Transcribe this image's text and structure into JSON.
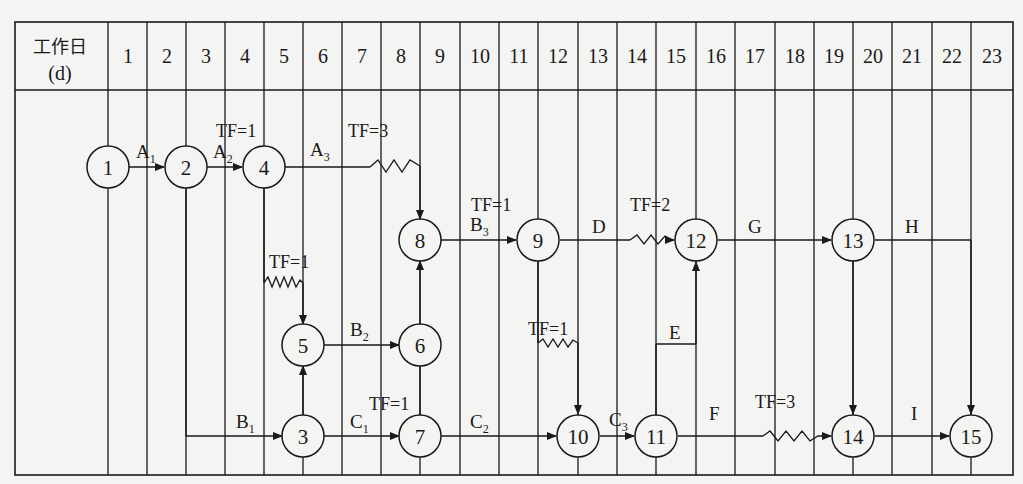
{
  "header": {
    "title_line1": "工作日",
    "title_line2": "(d)",
    "days": [
      "1",
      "2",
      "3",
      "4",
      "5",
      "6",
      "7",
      "8",
      "9",
      "10",
      "11",
      "12",
      "13",
      "14",
      "15",
      "16",
      "17",
      "18",
      "19",
      "20",
      "21",
      "22",
      "23"
    ]
  },
  "nodes": [
    {
      "id": "1",
      "label": "1",
      "day_line": 0,
      "row": "top"
    },
    {
      "id": "2",
      "label": "2",
      "day_line": 2,
      "row": "top"
    },
    {
      "id": "4",
      "label": "4",
      "day_line": 4,
      "row": "top"
    },
    {
      "id": "8",
      "label": "8",
      "day_line": 7,
      "row": "upper"
    },
    {
      "id": "9",
      "label": "9",
      "day_line": 10,
      "row": "upper"
    },
    {
      "id": "12",
      "label": "12",
      "day_line": 15,
      "row": "upper"
    },
    {
      "id": "13",
      "label": "13",
      "day_line": 19,
      "row": "upper"
    },
    {
      "id": "5",
      "label": "5",
      "day_line": 5,
      "row": "middle"
    },
    {
      "id": "6",
      "label": "6",
      "day_line": 8,
      "row": "middle"
    },
    {
      "id": "3",
      "label": "3",
      "day_line": 5,
      "row": "bottom"
    },
    {
      "id": "7",
      "label": "7",
      "day_line": 8,
      "row": "bottom"
    },
    {
      "id": "10",
      "label": "10",
      "day_line": 12,
      "row": "bottom"
    },
    {
      "id": "11",
      "label": "11",
      "day_line": 14,
      "row": "bottom"
    },
    {
      "id": "14",
      "label": "14",
      "day_line": 19,
      "row": "bottom"
    },
    {
      "id": "15",
      "label": "15",
      "day_line": 22,
      "row": "bottom"
    }
  ],
  "activities": [
    {
      "name": "A",
      "sub": "1",
      "from": "1",
      "to": "2"
    },
    {
      "name": "A",
      "sub": "2",
      "from": "2",
      "to": "4"
    },
    {
      "name": "A",
      "sub": "3",
      "from": "4",
      "to": "8",
      "free_float": "TF=3"
    },
    {
      "name": "B",
      "sub": "1",
      "from": "2",
      "to": "3"
    },
    {
      "name": "B",
      "sub": "2",
      "from": "5",
      "to": "6"
    },
    {
      "name": "B",
      "sub": "3",
      "from": "8",
      "to": "9",
      "free_float": "TF=1"
    },
    {
      "name": "C",
      "sub": "1",
      "from": "3",
      "to": "7",
      "free_float": "TF=1"
    },
    {
      "name": "C",
      "sub": "2",
      "from": "7",
      "to": "10"
    },
    {
      "name": "C",
      "sub": "3",
      "from": "10",
      "to": "11"
    },
    {
      "name": "D",
      "sub": "",
      "from": "9",
      "to": "12",
      "free_float": "TF=2"
    },
    {
      "name": "E",
      "sub": "",
      "from": "11",
      "to": "12"
    },
    {
      "name": "F",
      "sub": "",
      "from": "11",
      "to": "14",
      "free_float": "TF=3"
    },
    {
      "name": "G",
      "sub": "",
      "from": "12",
      "to": "13"
    },
    {
      "name": "H",
      "sub": "",
      "from": "13",
      "to": "15"
    },
    {
      "name": "I",
      "sub": "",
      "from": "14",
      "to": "15"
    }
  ],
  "dummies": [
    {
      "from": "4",
      "to": "5",
      "free_float": "TF=1"
    },
    {
      "from": "3",
      "to": "5"
    },
    {
      "from": "6",
      "to": "8"
    },
    {
      "from": "7",
      "to": "6"
    },
    {
      "from": "9",
      "to": "10",
      "free_float": "TF=1"
    },
    {
      "from": "13",
      "to": "14"
    }
  ],
  "labels": {
    "A1": "A",
    "A1s": "1",
    "A2": "A",
    "A2s": "2",
    "A3": "A",
    "A3s": "3",
    "B1": "B",
    "B1s": "1",
    "B2": "B",
    "B2s": "2",
    "B3": "B",
    "B3s": "3",
    "C1": "C",
    "C1s": "1",
    "C2": "C",
    "C2s": "2",
    "C3": "C",
    "C3s": "3",
    "D": "D",
    "E": "E",
    "F": "F",
    "G": "G",
    "H": "H",
    "I": "I",
    "tf_A2": "TF=1",
    "tf_A3": "TF=3",
    "tf_4_5": "TF=1",
    "tf_B3": "TF=1",
    "tf_D": "TF=2",
    "tf_9_10": "TF=1",
    "tf_C1": "TF=1",
    "tf_F": "TF=3"
  }
}
